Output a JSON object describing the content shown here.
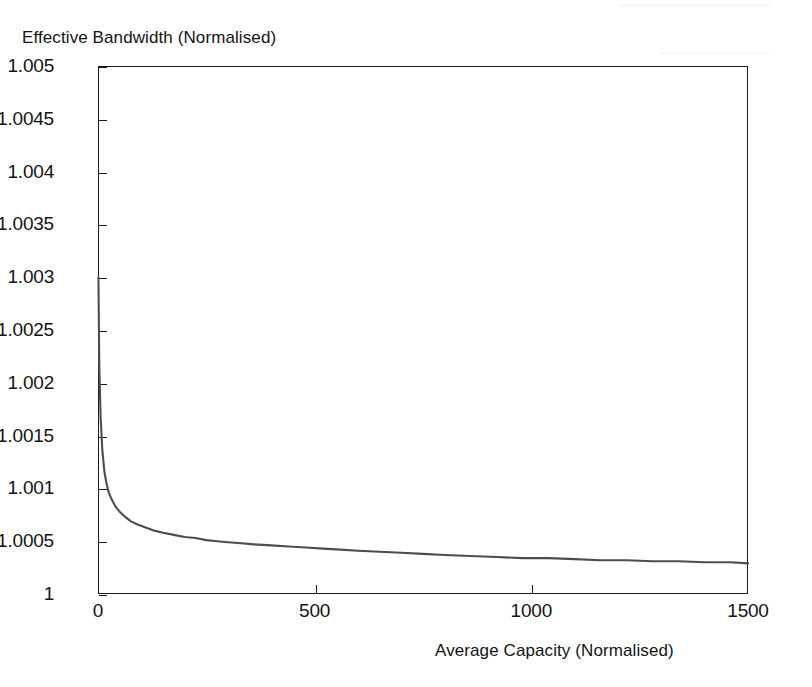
{
  "chart_data": {
    "type": "line",
    "title": "",
    "xlabel": "Average Capacity (Normalised)",
    "ylabel": "Effective Bandwidth (Normalised)",
    "xlim": [
      0,
      1500
    ],
    "ylim": [
      1,
      1.005
    ],
    "grid": false,
    "legend": null,
    "xticks": [
      0,
      500,
      1000,
      1500
    ],
    "xtick_labels": [
      "0",
      "500",
      "1000",
      "1500"
    ],
    "yticks": [
      1,
      1.0005,
      1.001,
      1.0015,
      1.002,
      1.0025,
      1.003,
      1.0035,
      1.004,
      1.0045,
      1.005
    ],
    "ytick_labels": [
      "1",
      "1.0005",
      "1.001",
      "1.0015",
      "1.002",
      "1.0025",
      "1.003",
      "1.0035",
      "1.004",
      "1.0045",
      "1.005"
    ],
    "line_color": "#4d4d4d",
    "series": [
      {
        "name": "effective bandwidth",
        "x": [
          1,
          3,
          6,
          10,
          15,
          20,
          25,
          30,
          40,
          50,
          60,
          75,
          90,
          110,
          130,
          150,
          175,
          200,
          225,
          250,
          275,
          300,
          330,
          360,
          400,
          440,
          480,
          520,
          560,
          600,
          650,
          700,
          750,
          800,
          860,
          920,
          980,
          1040,
          1100,
          1160,
          1220,
          1280,
          1340,
          1400,
          1460,
          1500
        ],
        "y": [
          1.003,
          1.00215,
          1.00168,
          1.00136,
          1.00115,
          1.00104,
          1.00096,
          1.00091,
          1.00083,
          1.00078,
          1.00074,
          1.00069,
          1.00066,
          1.00063,
          1.0006,
          1.00058,
          1.00056,
          1.00054,
          1.00053,
          1.00051,
          1.0005,
          1.00049,
          1.00048,
          1.00047,
          1.00046,
          1.00045,
          1.00044,
          1.00043,
          1.00042,
          1.00041,
          1.0004,
          1.00039,
          1.00038,
          1.00037,
          1.00036,
          1.00035,
          1.00034,
          1.00034,
          1.00033,
          1.00032,
          1.00032,
          1.00031,
          1.00031,
          1.0003,
          1.0003,
          1.00029
        ]
      }
    ]
  }
}
